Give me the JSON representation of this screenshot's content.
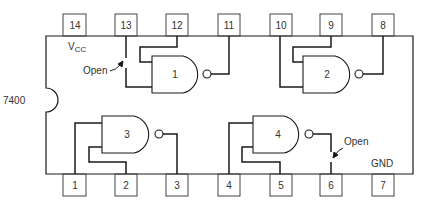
{
  "chip": {
    "part_number": "7400",
    "vcc_label": "V",
    "vcc_sub": "CC",
    "gnd_label": "GND"
  },
  "pins": {
    "top": [
      "14",
      "13",
      "12",
      "11",
      "10",
      "9",
      "8"
    ],
    "bottom": [
      "1",
      "2",
      "3",
      "4",
      "5",
      "6",
      "7"
    ]
  },
  "gates": [
    {
      "id": "1",
      "type": "NAND"
    },
    {
      "id": "2",
      "type": "NAND"
    },
    {
      "id": "3",
      "type": "NAND"
    },
    {
      "id": "4",
      "type": "NAND"
    }
  ],
  "annotations": {
    "open_top": "Open",
    "open_bottom": "Open"
  },
  "colors": {
    "line": "#1a1a1a",
    "text": "#333333",
    "background": "#ffffff"
  }
}
